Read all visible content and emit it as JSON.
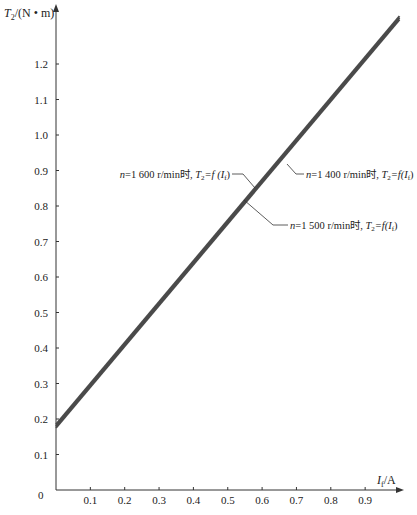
{
  "chart_data": {
    "type": "line",
    "title": "",
    "xlabel": "I_f/A",
    "ylabel": "T_2/(N • m)",
    "xlim": [
      0,
      1.0
    ],
    "ylim": [
      0,
      1.33
    ],
    "grid": false,
    "x_ticks": [
      "0.1",
      "0.2",
      "0.3",
      "0.4",
      "0.5",
      "0.6",
      "0.7",
      "0.8",
      "0.9"
    ],
    "y_ticks": [
      "0.1",
      "0.2",
      "0.3",
      "0.4",
      "0.5",
      "0.6",
      "0.7",
      "0.8",
      "0.9",
      "1.0",
      "1.1",
      "1.2"
    ],
    "origin_label": "0",
    "series": [
      {
        "name": "n=1 400 r/min时, T2=f(If)",
        "x": [
          0,
          1.0
        ],
        "y": [
          0.18,
          1.33
        ]
      },
      {
        "name": "n=1 500 r/min时, T2=f(If)",
        "x": [
          0,
          1.0
        ],
        "y": [
          0.175,
          1.325
        ]
      },
      {
        "name": "n=1 600 r/min时, T2=f(If)",
        "x": [
          0,
          1.0
        ],
        "y": [
          0.185,
          1.335
        ]
      }
    ],
    "annotations": [
      {
        "text_n": "n",
        "text_mid": "=1 400 r/min时, ",
        "text_T": "T",
        "sub2": "2",
        "text_eq": "=f(I",
        "subf": "f",
        "text_end": ")"
      },
      {
        "text_n": "n",
        "text_mid": "=1 500 r/min时, ",
        "text_T": "T",
        "sub2": "2",
        "text_eq": "=f(I",
        "subf": "f",
        "text_end": ")"
      },
      {
        "text_n": "n",
        "text_mid": "=1 600 r/min时, ",
        "text_T": "T",
        "sub2": "2",
        "text_eq": "=f (I",
        "subf": "f",
        "text_end": ")"
      }
    ],
    "legend_position": "none",
    "line_color": "#4a4a4a"
  },
  "axis": {
    "y_title_main": "T",
    "y_title_sub": "2",
    "y_title_rest": "/(N • m)",
    "x_title_main": "I",
    "x_title_sub": "f",
    "x_title_rest": "/A",
    "origin": "0"
  }
}
